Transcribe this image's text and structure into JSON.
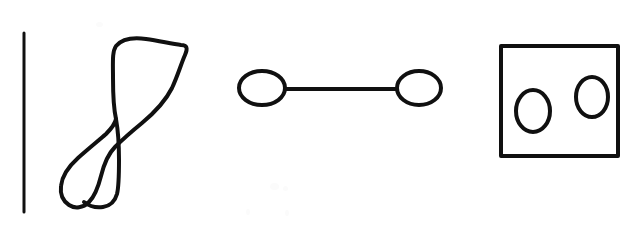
{
  "canvas": {
    "width": 637,
    "height": 230,
    "background_color": "#ffffff",
    "ink_color": "#101010",
    "description": "Hand-drawn black line sketch on white paper: a vertical line, a figure-eight loop, a dumbbell of two circles joined by a bar, and a rectangle containing two ovals."
  },
  "shapes": [
    {
      "id": "vertical-line",
      "name": "vertical-line",
      "type": "line",
      "stroke_width": 3,
      "x1": 24,
      "y1": 33,
      "x2": 24,
      "y2": 212
    },
    {
      "id": "figure-eight",
      "name": "figure-eight-loop",
      "type": "closed-freehand-curve",
      "stroke_width": 4,
      "crossing_point": {
        "x": 115,
        "y": 122
      },
      "bounds": {
        "x": 60,
        "y": 38,
        "width": 128,
        "height": 171
      },
      "path": "M 116 119 C 114 110 113 96 113 78 C 113 62 112 52 116 46 C 122 39 132 37 146 39 C 160 41 172 44 181 45 C 187 45 188 48 185 55 C 181 64 178 75 172 88 C 165 102 154 113 142 123 C 131 132 122 140 115 147 C 108 154 104 164 101 176 C 98 188 95 196 89 202 C 83 208 75 209 69 205 C 63 201 60 194 61 186 C 62 176 68 167 78 158 C 88 149 98 141 106 134 C 112 128 115 124 116 119 Z"
    },
    {
      "id": "figure-eight-tail",
      "name": "figure-eight-lower-tail",
      "type": "freehand-curve",
      "stroke_width": 4,
      "path": "M 116 119 C 118 130 119 146 119 160 C 119 174 119 186 117 194 C 115 201 110 206 103 207 C 96 208 89 206 84 202"
    },
    {
      "id": "dumbbell",
      "name": "dumbbell-shape",
      "type": "group",
      "stroke_width": 4,
      "left_ellipse": {
        "cx": 262,
        "cy": 88,
        "rx": 23,
        "ry": 17
      },
      "right_ellipse": {
        "cx": 419,
        "cy": 88,
        "rx": 22,
        "ry": 17
      },
      "connector": {
        "x1": 285,
        "y1": 89,
        "x2": 397,
        "y2": 89
      }
    },
    {
      "id": "rectangle-with-ovals",
      "name": "rectangle-with-two-ovals",
      "type": "group",
      "stroke_width": 4,
      "rectangle": {
        "x": 501,
        "y": 46,
        "width": 117,
        "height": 110
      },
      "left_oval": {
        "cx": 533,
        "cy": 111,
        "rx": 17,
        "ry": 21
      },
      "right_oval": {
        "cx": 592,
        "cy": 97,
        "rx": 16,
        "ry": 20
      }
    }
  ],
  "scan_artifacts": [
    {
      "x": 270,
      "y": 183,
      "w": 9,
      "h": 7
    },
    {
      "x": 283,
      "y": 186,
      "w": 5,
      "h": 5
    },
    {
      "x": 246,
      "y": 209,
      "w": 4,
      "h": 6
    },
    {
      "x": 285,
      "y": 210,
      "w": 4,
      "h": 6
    },
    {
      "x": 96,
      "y": 22,
      "w": 7,
      "h": 5
    }
  ]
}
